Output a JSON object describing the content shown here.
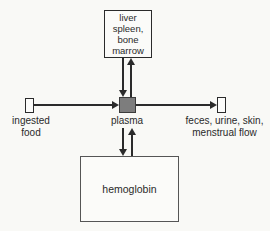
{
  "diagram": {
    "nodes": {
      "liver_spleen_bone_marrow": {
        "label": "liver\nspleen,\nbone\nmarrow"
      },
      "plasma": {
        "label": "plasma"
      },
      "ingested_food": {
        "label": "ingested\nfood"
      },
      "excretion": {
        "label": "feces, urine, skin,\nmenstrual flow"
      },
      "hemoglobin": {
        "label": "hemoglobin"
      }
    },
    "edges": [
      {
        "from": "ingested food",
        "to": "plasma",
        "type": "one-way"
      },
      {
        "from": "plasma",
        "to": "feces, urine, skin, menstrual flow",
        "type": "one-way"
      },
      {
        "from": "plasma",
        "to": "liver, spleen, bone marrow",
        "type": "two-way"
      },
      {
        "from": "plasma",
        "to": "hemoglobin",
        "type": "two-way"
      }
    ]
  },
  "colors": {
    "background": "#f9f9f6",
    "box_fill": "#fbfbf9",
    "line": "#2b2b2b",
    "plasma_fill": "#7d7d7d",
    "plasma_border": "#3c3c3c",
    "text": "#2a2a2a"
  }
}
